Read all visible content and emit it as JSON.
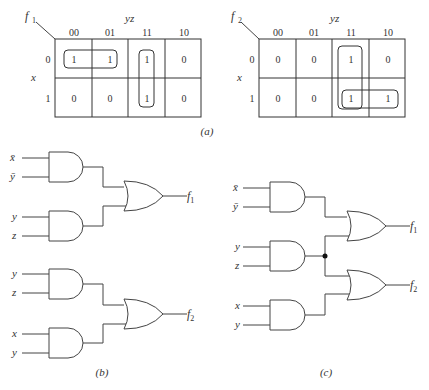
{
  "kmap_a": {
    "name": "f1",
    "col_var": "yz",
    "row_var": "x",
    "columns": [
      "00",
      "01",
      "11",
      "10"
    ],
    "rows": [
      "0",
      "1"
    ],
    "cells": [
      [
        "1",
        "1",
        "1",
        "0"
      ],
      [
        "0",
        "0",
        "1",
        "0"
      ]
    ]
  },
  "kmap_b": {
    "name": "f2",
    "col_var": "yz",
    "row_var": "x",
    "columns": [
      "00",
      "01",
      "11",
      "10"
    ],
    "rows": [
      "0",
      "1"
    ],
    "cells": [
      [
        "0",
        "0",
        "1",
        "0"
      ],
      [
        "0",
        "0",
        "1",
        "1"
      ]
    ]
  },
  "captions": {
    "a": "(a)",
    "b": "(b)",
    "c": "(c)"
  },
  "circuit_b": {
    "gate1_inputs": [
      "x̄",
      "ȳ"
    ],
    "gate2_inputs": [
      "y",
      "z"
    ],
    "gate3_inputs": [
      "y",
      "z"
    ],
    "gate4_inputs": [
      "x",
      "y"
    ],
    "out1": "f",
    "out1_sub": "1",
    "out2": "f",
    "out2_sub": "2"
  },
  "circuit_c": {
    "gate1_inputs": [
      "x̄",
      "ȳ"
    ],
    "gate2_inputs": [
      "y",
      "z"
    ],
    "gate3_inputs": [
      "x",
      "y"
    ],
    "out1": "f",
    "out1_sub": "1",
    "out2": "f",
    "out2_sub": "2"
  },
  "labels": {
    "f": "f",
    "sub1": "1",
    "sub2": "2"
  }
}
